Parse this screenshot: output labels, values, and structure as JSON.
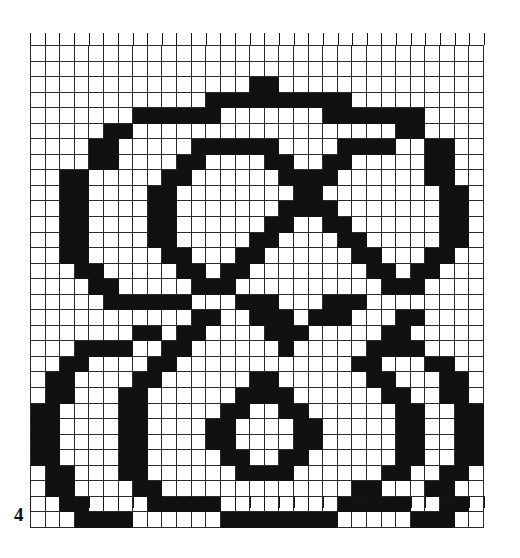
{
  "figure": {
    "number": "4",
    "type": "filet-crochet-chart",
    "title": "",
    "caption": "4"
  },
  "chart_data": {
    "type": "heatmap",
    "title": "",
    "subtitle": "",
    "xlabel": "",
    "ylabel": "",
    "grid": true,
    "legend_position": "none",
    "columns": 31,
    "rows": 31,
    "cell_size_px": 14.6,
    "colors": {
      "filled": "#111111",
      "empty": "#ffffff",
      "gridline": "#2b2b2b",
      "background": "#ffffff",
      "caption": "#101010"
    },
    "legend": [
      {
        "symbol": "filled",
        "label": "filled stitch",
        "color": "#111111"
      },
      {
        "symbol": "empty",
        "label": "open mesh",
        "color": "#ffffff"
      }
    ],
    "encoding": {
      "1": "filled cell",
      "0": "empty cell"
    },
    "categories": [
      "1",
      "2",
      "3",
      "4",
      "5",
      "6",
      "7",
      "8",
      "9",
      "10",
      "11",
      "12",
      "13",
      "14",
      "15",
      "16",
      "17",
      "18",
      "19",
      "20",
      "21",
      "22",
      "23",
      "24",
      "25",
      "26",
      "27",
      "28",
      "29",
      "30",
      "31"
    ],
    "row_labels": [
      "1",
      "2",
      "3",
      "4",
      "5",
      "6",
      "7",
      "8",
      "9",
      "10",
      "11",
      "12",
      "13",
      "14",
      "15",
      "16",
      "17",
      "18",
      "19",
      "20",
      "21",
      "22",
      "23",
      "24",
      "25",
      "26",
      "27",
      "28",
      "29",
      "30",
      "31"
    ],
    "rows_bitmap": [
      "0000000000000000000000000000000",
      "0000000000000000000000000000000",
      "0000000000000001100000000000000",
      "0000000000001111111111000000000",
      "0000000111111000000011111110000",
      "0000011000000000000000000110000",
      "0000110000011111100001111001100",
      "0000110000110000110011000001100",
      "0011000001100000011110000001100",
      "0011000011000000001100000000110",
      "0011000011000000011110000000110",
      "0011000011000000110011000000110",
      "0011000011000001100001100000110",
      "0011000001100011000000110001100",
      "0001100000110110000000011011000",
      "0000110000011100000000001110000",
      "0000011111100011100011100000000",
      "0000000000011001110111000110000",
      "0000000110110000111000001100000",
      "0001111001100000010000011110000",
      "0011000011000000000000110001100",
      "0110000110000001100000011000110",
      "0110001100000011110000001100110",
      "1100001100000110011000001100011",
      "1100001100001100001100001100011",
      "1100001100001100001100001100011",
      "1100001100000110011000001100011",
      "0110001100000011110000001100110",
      "0110000110000000000000011000110",
      "0011000011111000000001111100110",
      "0001111000000111111110000011100"
    ],
    "values": [
      [
        0,
        0,
        0,
        0,
        0,
        0,
        0,
        0,
        0,
        0,
        0,
        0,
        0,
        0,
        0,
        0,
        0,
        0,
        0,
        0,
        0,
        0,
        0,
        0,
        0,
        0,
        0,
        0,
        0,
        0,
        0
      ],
      [
        0,
        0,
        0,
        0,
        0,
        0,
        0,
        0,
        0,
        0,
        0,
        0,
        0,
        0,
        0,
        0,
        0,
        0,
        0,
        0,
        0,
        0,
        0,
        0,
        0,
        0,
        0,
        0,
        0,
        0,
        0
      ],
      [
        0,
        0,
        0,
        0,
        0,
        0,
        0,
        0,
        0,
        0,
        0,
        0,
        0,
        0,
        0,
        1,
        1,
        0,
        0,
        0,
        0,
        0,
        0,
        0,
        0,
        0,
        0,
        0,
        0,
        0,
        0
      ],
      [
        0,
        0,
        0,
        0,
        0,
        0,
        0,
        0,
        0,
        0,
        0,
        0,
        1,
        1,
        1,
        1,
        1,
        1,
        1,
        1,
        1,
        1,
        0,
        0,
        0,
        0,
        0,
        0,
        0,
        0,
        0
      ],
      [
        0,
        0,
        0,
        0,
        0,
        0,
        0,
        1,
        1,
        1,
        1,
        1,
        1,
        0,
        0,
        0,
        0,
        0,
        0,
        0,
        1,
        1,
        1,
        1,
        1,
        1,
        1,
        0,
        0,
        0,
        0
      ],
      [
        0,
        0,
        0,
        0,
        0,
        1,
        1,
        0,
        0,
        0,
        0,
        0,
        0,
        0,
        0,
        0,
        0,
        0,
        0,
        0,
        0,
        0,
        0,
        0,
        0,
        1,
        1,
        0,
        0,
        0,
        0
      ],
      [
        0,
        0,
        0,
        0,
        1,
        1,
        0,
        0,
        0,
        0,
        0,
        1,
        1,
        1,
        1,
        1,
        1,
        0,
        0,
        0,
        0,
        1,
        1,
        1,
        1,
        0,
        0,
        1,
        1,
        0,
        0
      ],
      [
        0,
        0,
        0,
        0,
        1,
        1,
        0,
        0,
        0,
        0,
        1,
        1,
        0,
        0,
        0,
        0,
        1,
        1,
        0,
        0,
        1,
        1,
        0,
        0,
        0,
        0,
        0,
        1,
        1,
        0,
        0
      ],
      [
        0,
        0,
        1,
        1,
        0,
        0,
        0,
        0,
        0,
        1,
        1,
        0,
        0,
        0,
        0,
        0,
        0,
        1,
        1,
        1,
        1,
        0,
        0,
        0,
        0,
        0,
        0,
        1,
        1,
        0,
        0
      ],
      [
        0,
        0,
        1,
        1,
        0,
        0,
        0,
        0,
        1,
        1,
        0,
        0,
        0,
        0,
        0,
        0,
        0,
        0,
        1,
        1,
        0,
        0,
        0,
        0,
        0,
        0,
        0,
        0,
        1,
        1,
        0
      ],
      [
        0,
        0,
        1,
        1,
        0,
        0,
        0,
        0,
        1,
        1,
        0,
        0,
        0,
        0,
        0,
        0,
        0,
        1,
        1,
        1,
        1,
        0,
        0,
        0,
        0,
        0,
        0,
        0,
        1,
        1,
        0
      ],
      [
        0,
        0,
        1,
        1,
        0,
        0,
        0,
        0,
        1,
        1,
        0,
        0,
        0,
        0,
        0,
        0,
        1,
        1,
        0,
        0,
        1,
        1,
        0,
        0,
        0,
        0,
        0,
        0,
        1,
        1,
        0
      ],
      [
        0,
        0,
        1,
        1,
        0,
        0,
        0,
        0,
        1,
        1,
        0,
        0,
        0,
        0,
        0,
        1,
        1,
        0,
        0,
        0,
        0,
        1,
        1,
        0,
        0,
        0,
        0,
        0,
        1,
        1,
        0
      ],
      [
        0,
        0,
        1,
        1,
        0,
        0,
        0,
        0,
        0,
        1,
        1,
        0,
        0,
        0,
        1,
        1,
        0,
        0,
        0,
        0,
        0,
        0,
        1,
        1,
        0,
        0,
        0,
        1,
        1,
        0,
        0
      ],
      [
        0,
        0,
        0,
        1,
        1,
        0,
        0,
        0,
        0,
        0,
        1,
        1,
        0,
        1,
        1,
        0,
        0,
        0,
        0,
        0,
        0,
        0,
        0,
        1,
        1,
        0,
        1,
        1,
        0,
        0,
        0
      ],
      [
        0,
        0,
        0,
        0,
        1,
        1,
        0,
        0,
        0,
        0,
        0,
        1,
        1,
        1,
        0,
        0,
        0,
        0,
        0,
        0,
        0,
        0,
        0,
        0,
        1,
        1,
        1,
        0,
        0,
        0,
        0
      ],
      [
        0,
        0,
        0,
        0,
        0,
        1,
        1,
        1,
        1,
        1,
        1,
        0,
        0,
        0,
        1,
        1,
        1,
        0,
        0,
        0,
        1,
        1,
        1,
        0,
        0,
        0,
        0,
        0,
        0,
        0,
        0
      ],
      [
        0,
        0,
        0,
        0,
        0,
        0,
        0,
        0,
        0,
        0,
        0,
        1,
        1,
        0,
        0,
        1,
        1,
        1,
        0,
        1,
        1,
        1,
        0,
        0,
        0,
        1,
        1,
        0,
        0,
        0,
        0
      ],
      [
        0,
        0,
        0,
        0,
        0,
        0,
        0,
        1,
        1,
        0,
        1,
        1,
        0,
        0,
        0,
        0,
        1,
        1,
        1,
        0,
        0,
        0,
        0,
        0,
        1,
        1,
        0,
        0,
        0,
        0,
        0
      ],
      [
        0,
        0,
        0,
        1,
        1,
        1,
        1,
        0,
        0,
        1,
        1,
        0,
        0,
        0,
        0,
        0,
        0,
        1,
        0,
        0,
        0,
        0,
        0,
        1,
        1,
        1,
        1,
        0,
        0,
        0,
        0
      ],
      [
        0,
        0,
        1,
        1,
        0,
        0,
        0,
        0,
        1,
        1,
        0,
        0,
        0,
        0,
        0,
        0,
        0,
        0,
        0,
        0,
        0,
        0,
        1,
        1,
        0,
        0,
        0,
        1,
        1,
        0,
        0
      ],
      [
        0,
        1,
        1,
        0,
        0,
        0,
        0,
        1,
        1,
        0,
        0,
        0,
        0,
        0,
        0,
        1,
        1,
        0,
        0,
        0,
        0,
        0,
        0,
        1,
        1,
        0,
        0,
        0,
        1,
        1,
        0
      ],
      [
        0,
        1,
        1,
        0,
        0,
        0,
        1,
        1,
        0,
        0,
        0,
        0,
        0,
        0,
        1,
        1,
        1,
        1,
        0,
        0,
        0,
        0,
        0,
        0,
        1,
        1,
        0,
        0,
        1,
        1,
        0
      ],
      [
        1,
        1,
        0,
        0,
        0,
        0,
        1,
        1,
        0,
        0,
        0,
        0,
        0,
        1,
        1,
        0,
        0,
        1,
        1,
        0,
        0,
        0,
        0,
        0,
        0,
        1,
        1,
        0,
        0,
        1,
        1
      ],
      [
        1,
        1,
        0,
        0,
        0,
        0,
        1,
        1,
        0,
        0,
        0,
        0,
        1,
        1,
        0,
        0,
        0,
        0,
        1,
        1,
        0,
        0,
        0,
        0,
        0,
        1,
        1,
        0,
        0,
        1,
        1
      ],
      [
        1,
        1,
        0,
        0,
        0,
        0,
        1,
        1,
        0,
        0,
        0,
        0,
        1,
        1,
        0,
        0,
        0,
        0,
        1,
        1,
        0,
        0,
        0,
        0,
        0,
        1,
        1,
        0,
        0,
        1,
        1
      ],
      [
        1,
        1,
        0,
        0,
        0,
        0,
        1,
        1,
        0,
        0,
        0,
        0,
        0,
        1,
        1,
        0,
        0,
        1,
        1,
        0,
        0,
        0,
        0,
        0,
        0,
        1,
        1,
        0,
        0,
        1,
        1
      ],
      [
        0,
        1,
        1,
        0,
        0,
        0,
        1,
        1,
        0,
        0,
        0,
        0,
        0,
        0,
        1,
        1,
        1,
        1,
        0,
        0,
        0,
        0,
        0,
        0,
        1,
        1,
        0,
        0,
        1,
        1,
        0
      ],
      [
        0,
        1,
        1,
        0,
        0,
        0,
        0,
        1,
        1,
        0,
        0,
        0,
        0,
        0,
        0,
        0,
        0,
        0,
        0,
        0,
        0,
        0,
        1,
        1,
        0,
        0,
        0,
        1,
        1,
        0,
        0
      ],
      [
        0,
        0,
        1,
        1,
        0,
        0,
        0,
        0,
        1,
        1,
        1,
        1,
        1,
        0,
        0,
        0,
        0,
        0,
        0,
        0,
        0,
        1,
        1,
        1,
        1,
        1,
        0,
        0,
        1,
        1,
        0
      ],
      [
        0,
        0,
        0,
        1,
        1,
        1,
        1,
        0,
        0,
        0,
        0,
        0,
        0,
        1,
        1,
        1,
        1,
        1,
        1,
        1,
        1,
        0,
        0,
        0,
        0,
        0,
        1,
        1,
        1,
        0,
        0
      ]
    ]
  },
  "ticks": {
    "top_count": 31,
    "bottom_count": 31
  }
}
